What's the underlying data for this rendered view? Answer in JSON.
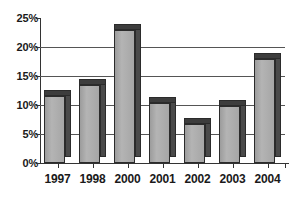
{
  "chart_data": {
    "type": "bar",
    "title": "",
    "subtitle": "",
    "xlabel": "",
    "ylabel": "",
    "categories": [
      "1997",
      "1998",
      "2000",
      "2001",
      "2002",
      "2003",
      "2004"
    ],
    "values": [
      11.5,
      13.5,
      23.0,
      10.3,
      6.8,
      9.8,
      18.0
    ],
    "value_unit": "%",
    "ylim": [
      0,
      25
    ],
    "ytick_values": [
      0,
      5,
      10,
      15,
      20,
      25
    ],
    "ytick_labels": [
      "0%",
      "5%",
      "10%",
      "15%",
      "20%",
      "25%"
    ],
    "grid": true,
    "grid_axis": "y",
    "legend": false,
    "legend_position": "none",
    "style": "3d-column",
    "series": [
      {
        "name": "",
        "values": [
          11.5,
          13.5,
          23.0,
          10.3,
          6.8,
          9.8,
          18.0
        ]
      }
    ],
    "colors": {
      "bar_face": "#a6a6a6",
      "bar_side": "#4a4a4a",
      "bar_top": "#3d3d3d",
      "bar_outline": "#2b2b2b",
      "gridline": "#555555",
      "axis": "#333333",
      "text": "#1a1a1a",
      "background": "#ffffff"
    }
  }
}
